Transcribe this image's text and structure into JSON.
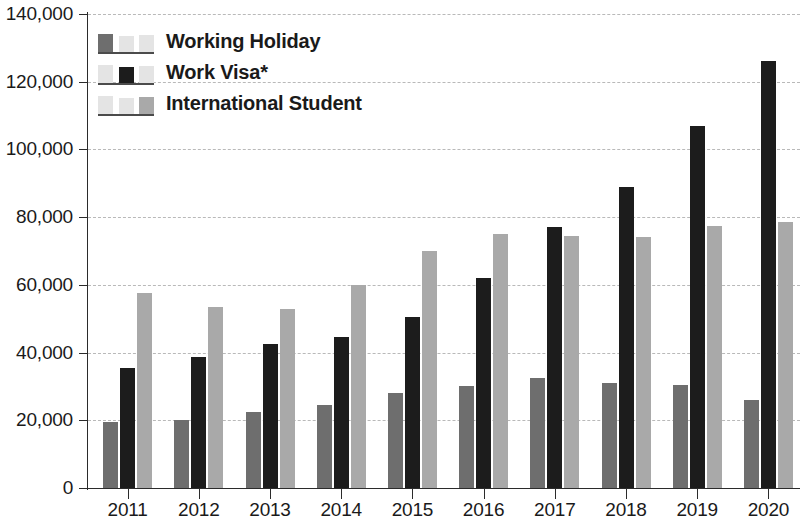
{
  "chart_data": {
    "type": "bar",
    "title": "",
    "subtitle": "",
    "xlabel": "",
    "ylabel": "",
    "categories": [
      "2011",
      "2012",
      "2013",
      "2014",
      "2015",
      "2016",
      "2017",
      "2018",
      "2019",
      "2020"
    ],
    "series": [
      {
        "name": "Working Holiday",
        "color": "#6e6e6e",
        "values": [
          19500,
          20000,
          22500,
          24500,
          28000,
          30000,
          32500,
          31000,
          30500,
          26000
        ]
      },
      {
        "name": "Work Visa*",
        "color": "#1c1c1c",
        "values": [
          35500,
          38800,
          42500,
          44500,
          50500,
          62000,
          77000,
          89000,
          107000,
          126000
        ]
      },
      {
        "name": "International Student",
        "color": "#a9a9a9",
        "values": [
          57500,
          53500,
          53000,
          60000,
          70000,
          75000,
          74500,
          74000,
          77500,
          78500
        ]
      }
    ],
    "ylim": [
      0,
      140000
    ],
    "ytick_values": [
      0,
      20000,
      40000,
      60000,
      80000,
      100000,
      120000,
      140000
    ],
    "ytick_labels": [
      "0",
      "20,000",
      "40,000",
      "60,000",
      "80,000",
      "100,000",
      "120,000",
      "140,000"
    ],
    "grid": true,
    "legend_position": "top-left"
  },
  "legend": {
    "items": [
      {
        "label": "Working Holiday"
      },
      {
        "label": "Work Visa*"
      },
      {
        "label": "International Student"
      }
    ]
  }
}
